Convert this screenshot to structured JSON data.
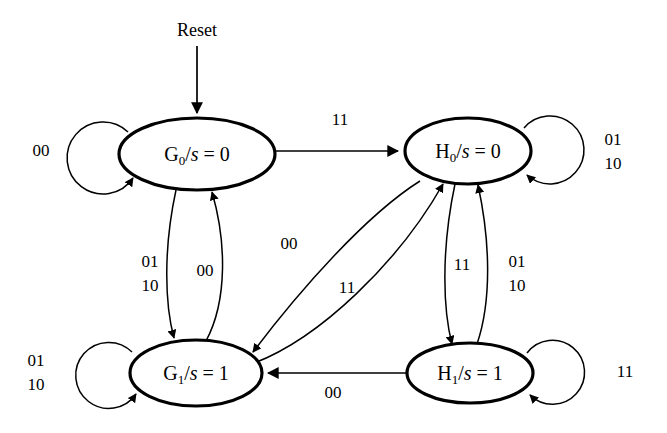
{
  "diagram": {
    "type": "finite-state-machine",
    "background_color": "#ffffff",
    "line_color": "#000000",
    "reset": {
      "label": "Reset",
      "target": "G0"
    },
    "states": [
      {
        "id": "G0",
        "name": "G",
        "subscript": "0",
        "separator": "/",
        "output_var": "s",
        "equals": "=",
        "output_value": "0",
        "full_label": "G0/s = 0",
        "cx": 197,
        "cy": 154,
        "rx": 78,
        "ry": 36
      },
      {
        "id": "H0",
        "name": "H",
        "subscript": "0",
        "separator": "/",
        "output_var": "s",
        "equals": "=",
        "output_value": "0",
        "full_label": "H0/s = 0",
        "cx": 468,
        "cy": 151,
        "rx": 63,
        "ry": 33
      },
      {
        "id": "G1",
        "name": "G",
        "subscript": "1",
        "separator": "/",
        "output_var": "s",
        "equals": "=",
        "output_value": "1",
        "full_label": "G1/s = 1",
        "cx": 196,
        "cy": 373,
        "rx": 66,
        "ry": 33
      },
      {
        "id": "H1",
        "name": "H",
        "subscript": "1",
        "separator": "/",
        "output_var": "s",
        "equals": "=",
        "output_value": "1",
        "full_label": "H1/s = 1",
        "cx": 470,
        "cy": 373,
        "rx": 63,
        "ry": 30
      }
    ],
    "transitions": [
      {
        "id": "G0-self",
        "from": "G0",
        "to": "G0",
        "label": "00",
        "label_lines": [
          "00"
        ],
        "lx": 41,
        "ly": 152
      },
      {
        "id": "G0-H0",
        "from": "G0",
        "to": "H0",
        "label": "11",
        "label_lines": [
          "11"
        ],
        "lx": 340,
        "ly": 121
      },
      {
        "id": "H0-self",
        "from": "H0",
        "to": "H0",
        "label": "01 10",
        "label_lines": [
          "01",
          "10"
        ],
        "lx": 613,
        "ly": 152
      },
      {
        "id": "G0-G1",
        "from": "G0",
        "to": "G1",
        "label": "01 10",
        "label_lines": [
          "01",
          "10"
        ],
        "lx": 150,
        "ly": 273
      },
      {
        "id": "G1-G0",
        "from": "G1",
        "to": "G0",
        "label": "00",
        "label_lines": [
          "00"
        ],
        "lx": 203,
        "ly": 262
      },
      {
        "id": "H0-G1",
        "from": "H0",
        "to": "G1",
        "label": "00",
        "label_lines": [
          "00"
        ],
        "lx": 289,
        "ly": 245
      },
      {
        "id": "G1-H0",
        "from": "G1",
        "to": "H0",
        "label": "11",
        "label_lines": [
          "11"
        ],
        "lx": 347,
        "ly": 289
      },
      {
        "id": "H0-H1",
        "from": "H0",
        "to": "H1",
        "label": "11",
        "label_lines": [
          "11"
        ],
        "lx": 462,
        "ly": 266
      },
      {
        "id": "H1-H0",
        "from": "H1",
        "to": "H0",
        "label": "01 10",
        "label_lines": [
          "01",
          "10"
        ],
        "lx": 515,
        "ly": 273
      },
      {
        "id": "G1-self",
        "from": "G1",
        "to": "G1",
        "label": "01 10",
        "label_lines": [
          "01",
          "10"
        ],
        "lx": 36,
        "ly": 372
      },
      {
        "id": "H1-G1",
        "from": "H1",
        "to": "G1",
        "label": "00",
        "label_lines": [
          "00"
        ],
        "lx": 333,
        "ly": 392
      },
      {
        "id": "H1-self",
        "from": "H1",
        "to": "H1",
        "label": "11",
        "label_lines": [
          "11"
        ],
        "lx": 625,
        "ly": 373
      }
    ]
  }
}
